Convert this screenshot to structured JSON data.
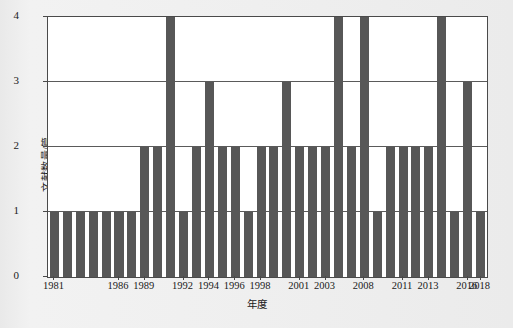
{
  "chart_data": {
    "type": "bar",
    "title": "",
    "xlabel": "年度",
    "ylabel": "文献数量/篇",
    "ylim": [
      0,
      4
    ],
    "yticks": [
      0,
      1,
      2,
      3,
      4
    ],
    "grid": true,
    "legend": null,
    "categories": [
      "1981",
      "1982",
      "1983",
      "1984",
      "1985",
      "1986",
      "1987",
      "1989",
      "1990",
      "1991",
      "1992",
      "1993",
      "1994",
      "1995",
      "1996",
      "1997",
      "1998",
      "1999",
      "2000",
      "2001",
      "2002",
      "2003",
      "2005",
      "2006",
      "2008",
      "2009",
      "2010",
      "2011",
      "2012",
      "2013",
      "2014",
      "2015",
      "2016",
      "2018"
    ],
    "values": [
      1,
      1,
      1,
      1,
      1,
      1,
      1,
      2,
      2,
      4,
      1,
      2,
      3,
      2,
      2,
      1,
      2,
      2,
      3,
      2,
      2,
      2,
      4,
      2,
      4,
      1,
      2,
      2,
      2,
      2,
      4,
      1,
      3,
      1
    ],
    "xtick_labels": [
      "1981",
      "1986",
      "1989",
      "1992",
      "1994",
      "1996",
      "1998",
      "2001",
      "2003",
      "2008",
      "2011",
      "2013",
      "2016",
      "2018"
    ],
    "xtick_indices": [
      0,
      5,
      7,
      10,
      12,
      14,
      16,
      19,
      21,
      24,
      27,
      29,
      32,
      33
    ],
    "bar_color": "#575757",
    "axis_color": "#4a4a4a",
    "plot_background": "#ffffff",
    "figure_background": "#eeeeee"
  }
}
